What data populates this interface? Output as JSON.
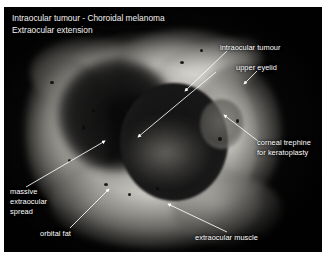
{
  "figure": {
    "title_line1": "Intraocular tumour - Choroidal melanoma",
    "title_line2": "Extraocular extension",
    "background_color": "#050505",
    "page_background": "#ffffff",
    "label_color": "#ffffff"
  },
  "labels": [
    {
      "id": "intraocular-tumour",
      "text": "intraocular tumour"
    },
    {
      "id": "upper-eyelid",
      "text": "upper eyelid"
    },
    {
      "id": "corneal-trephine-line1",
      "text": "corneal trephine"
    },
    {
      "id": "corneal-trephine-line2",
      "text": "for keratoplasty"
    },
    {
      "id": "massive-spread-line1",
      "text": "massive"
    },
    {
      "id": "massive-spread-line2",
      "text": "extraocular"
    },
    {
      "id": "massive-spread-line3",
      "text": "spread"
    },
    {
      "id": "orbital-fat",
      "text": "orbital fat"
    },
    {
      "id": "extraocular-muscle",
      "text": "extraocular muscle"
    }
  ],
  "specimen": {
    "description": "Gross pathology photograph of enucleated globe with extraocular tumour extension"
  }
}
